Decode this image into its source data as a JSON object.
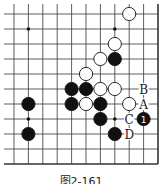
{
  "diagram": {
    "type": "go-board-partial",
    "columns": 11,
    "rows": 11,
    "grid": {
      "x_start": 14,
      "x_step": 14.4,
      "y_start": 14,
      "y_step": 15,
      "open_left": true,
      "open_top": true,
      "edge_right": true,
      "edge_bottom": true
    },
    "star_points": [
      {
        "col": 1,
        "row": 1
      },
      {
        "col": 7,
        "row": 1
      },
      {
        "col": 1,
        "row": 7
      },
      {
        "col": 7,
        "row": 7
      }
    ],
    "stones": [
      {
        "color": "white",
        "col": 8,
        "row": 0
      },
      {
        "color": "white",
        "col": 7,
        "row": 2
      },
      {
        "color": "white",
        "col": 6,
        "row": 3
      },
      {
        "color": "black",
        "col": 7,
        "row": 3
      },
      {
        "color": "white",
        "col": 5,
        "row": 4
      },
      {
        "color": "black",
        "col": 4,
        "row": 5
      },
      {
        "color": "black",
        "col": 5,
        "row": 5
      },
      {
        "color": "white",
        "col": 6,
        "row": 5
      },
      {
        "color": "white",
        "col": 7,
        "row": 5
      },
      {
        "color": "black",
        "col": 1,
        "row": 6
      },
      {
        "color": "black",
        "col": 4,
        "row": 6
      },
      {
        "color": "white",
        "col": 5,
        "row": 6
      },
      {
        "color": "black",
        "col": 6,
        "row": 6
      },
      {
        "color": "white",
        "col": 8,
        "row": 6
      },
      {
        "color": "black",
        "col": 6,
        "row": 7
      },
      {
        "color": "black",
        "col": 9,
        "row": 7,
        "number": "1"
      },
      {
        "color": "black",
        "col": 1,
        "row": 8
      },
      {
        "color": "black",
        "col": 7,
        "row": 8
      }
    ],
    "labels": [
      {
        "text": "B",
        "col": 9,
        "row": 5
      },
      {
        "text": "A",
        "col": 9,
        "row": 6
      },
      {
        "text": "C",
        "col": 8,
        "row": 7
      },
      {
        "text": "D",
        "col": 8,
        "row": 8
      }
    ],
    "colors": {
      "line": "#333333",
      "black_stone": "#111111",
      "white_stone": "#ffffff"
    }
  },
  "caption": "图2-161"
}
